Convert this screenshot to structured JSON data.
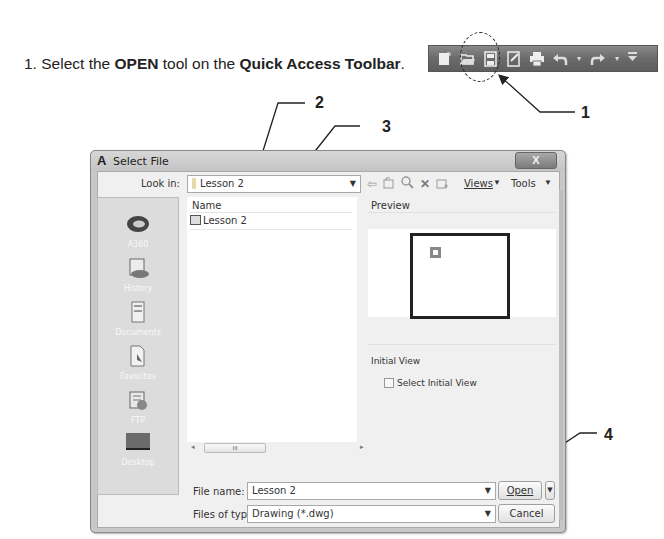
{
  "instruction": {
    "step": "1.",
    "prefix": "Select the",
    "tool": "OPEN",
    "middle": "tool on the",
    "location": "Quick Access Toolbar",
    "suffix": "."
  },
  "quick_access_toolbar": {
    "icons": [
      "new-icon",
      "open-icon",
      "save-icon",
      "save-as-icon",
      "print-icon",
      "undo-icon",
      "redo-icon",
      "customize-icon"
    ]
  },
  "callouts": [
    "1",
    "2",
    "3",
    "4"
  ],
  "dialog": {
    "title": "Select File",
    "close_label": "X",
    "look_in_label": "Look in:",
    "look_in_value": "Lesson 2",
    "toolbar": {
      "views_label": "Views",
      "tools_label": "Tools"
    },
    "places": [
      "A360",
      "History",
      "Documents",
      "Favorites",
      "FTP",
      "Desktop"
    ],
    "list": {
      "column_header": "Name",
      "items": [
        "Lesson 2"
      ],
      "scroll_thumb": "III"
    },
    "preview_label": "Preview",
    "initial_view_label": "Initial View",
    "select_initial_view_label": "Select Initial View",
    "file_name_label": "File name:",
    "file_name_value": "Lesson 2",
    "files_of_type_label": "Files of type:",
    "files_of_type_value": "Drawing (*.dwg)",
    "open_label": "Open",
    "cancel_label": "Cancel"
  }
}
